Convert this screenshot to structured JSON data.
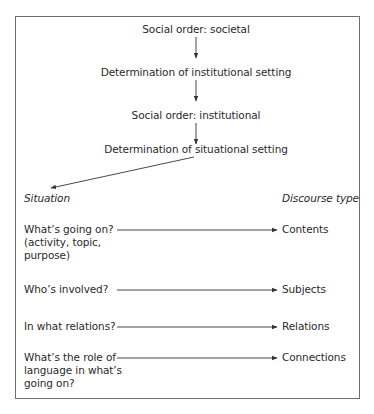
{
  "diagram": {
    "flow": [
      {
        "id": "societal",
        "label": "Social order: societal"
      },
      {
        "id": "institutional_setting",
        "label": "Determination of institutional setting"
      },
      {
        "id": "institutional",
        "label": "Social order: institutional"
      },
      {
        "id": "situational_setting",
        "label": "Determination of situational setting"
      }
    ],
    "columns": {
      "left_header": "Situation",
      "right_header": "Discourse type"
    },
    "rows": [
      {
        "situation": [
          "What’s going on?",
          "(activity, topic,",
          "purpose)"
        ],
        "discourse": "Contents"
      },
      {
        "situation": [
          "Who’s involved?"
        ],
        "discourse": "Subjects"
      },
      {
        "situation": [
          "In what relations?"
        ],
        "discourse": "Relations"
      },
      {
        "situation": [
          "What’s the role of",
          "language in what’s",
          "going on?"
        ],
        "discourse": "Connections"
      }
    ],
    "colors": {
      "text": "#2a2a2a",
      "border": "#6e6e6e",
      "arrow": "#333333"
    }
  }
}
